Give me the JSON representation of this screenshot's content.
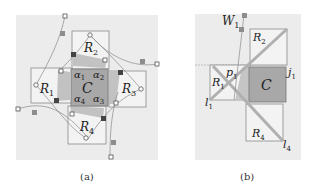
{
  "figure": {
    "panel_a": {
      "caption": "(a)",
      "center_label": "C",
      "regions": [
        "R",
        "R",
        "R",
        "R"
      ],
      "region_subscripts": [
        "1",
        "2",
        "3",
        "4"
      ],
      "corner_labels": [
        "α",
        "α",
        "α",
        "α"
      ],
      "corner_subscripts": [
        "1",
        "2",
        "3",
        "4"
      ]
    },
    "panel_b": {
      "caption": "(b)",
      "center_label": "C",
      "labels": [
        {
          "base": "W",
          "sub": "1"
        },
        {
          "base": "R",
          "sub": "2"
        },
        {
          "base": "R",
          "sub": "1"
        },
        {
          "base": "p",
          "sub": "1"
        },
        {
          "base": "j",
          "sub": "1"
        },
        {
          "base": "l",
          "sub": "1"
        },
        {
          "base": "R",
          "sub": "4"
        },
        {
          "base": "l",
          "sub": "4"
        }
      ]
    },
    "colors": {
      "panel_bg": "#ececec",
      "center_fill": "#a8a8a8",
      "region_fill": "#f2f2f2",
      "outline": "#8a8a8a",
      "diag": "#b0b0b0",
      "marker_dark": "#555555"
    }
  }
}
